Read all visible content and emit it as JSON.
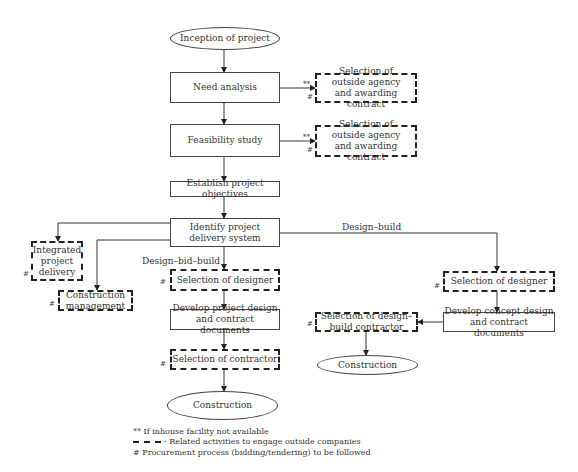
{
  "diagram": {
    "nodes": {
      "inception": "Inception of project",
      "need_analysis": "Need analysis",
      "outside_agency_1": "Selection of outside agency and awarding contract",
      "feasibility": "Feasibility study",
      "outside_agency_2": "Selection of outside agency and awarding contract",
      "objectives": "Establish project objectives",
      "delivery_system": "Identify project delivery system",
      "integrated": "Integrated project delivery",
      "construction_mgmt": "Construction management",
      "dbb_designer": "Selection of designer",
      "dbb_documents": "Develop project design and contract documents",
      "dbb_contractor": "Selection of contractor",
      "dbb_construction": "Construction",
      "db_designer": "Selection of designer",
      "db_documents": "Develop concept design and contract documents",
      "db_contractor": "Selection of design–build contractor",
      "db_construction": "Construction"
    },
    "edge_labels": {
      "design_build": "Design–build",
      "design_bid_build": "Design–bid–build"
    },
    "marks": {
      "double_star": "**",
      "hash": "#"
    },
    "legend": {
      "double_star": "** If inhouse facility not available",
      "dashed": "- Related activities to engage outside companies",
      "hash": "# Procurement process (bidding/tendering) to be followed"
    }
  }
}
